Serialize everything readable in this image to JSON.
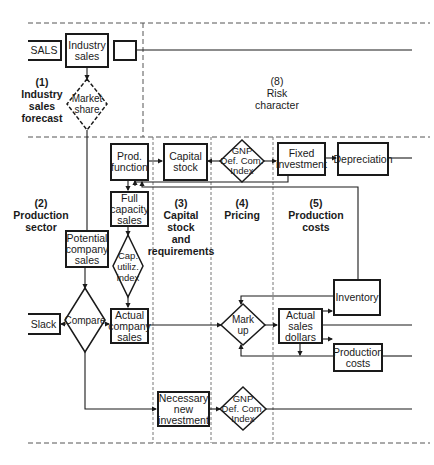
{
  "sections": [
    {
      "number": "(1)",
      "lines": [
        "Industry",
        "sales",
        "forecast"
      ]
    },
    {
      "number": "(2)",
      "lines": [
        "Production",
        "sector"
      ]
    },
    {
      "number": "(3)",
      "lines": [
        "Capital",
        "stock",
        "and",
        "requirements"
      ]
    },
    {
      "number": "(4)",
      "lines": [
        "Pricing"
      ]
    },
    {
      "number": "(5)",
      "lines": [
        "Production",
        "costs"
      ]
    },
    {
      "number": "(8)",
      "lines": [
        "Risk",
        "character"
      ]
    }
  ],
  "boxes": {
    "sals": "SALS",
    "industry_sales": [
      "Industry",
      "sales"
    ],
    "prod_function": [
      "Prod.",
      "function"
    ],
    "capital_stock": [
      "Capital",
      "stock"
    ],
    "fixed_investment": [
      "Fixed",
      "investment"
    ],
    "depreciation": "Depreciation",
    "full_capacity_sales": [
      "Full",
      "capacity",
      "sales"
    ],
    "potential_company_sales": [
      "Potential",
      "company",
      "sales"
    ],
    "slack": "Slack",
    "actual_company_sales": [
      "Actual",
      "company",
      "sales"
    ],
    "actual_sales_dollars": [
      "Actual",
      "sales",
      "dollars"
    ],
    "inventory": "Inventory",
    "production_costs": [
      "Production",
      "costs"
    ],
    "necessary_new_investment": [
      "Necessary",
      "new",
      "investment"
    ]
  },
  "diamonds": {
    "market_share": [
      "Market",
      "share"
    ],
    "gnp_top": [
      "GNP",
      "Def. Com.",
      "Index"
    ],
    "cap_utiliz_index": [
      "Cap.",
      "utiliz.",
      "index"
    ],
    "compare": "Compare",
    "mark_up": [
      "Mark",
      "up"
    ],
    "gnp_bottom": [
      "GNP",
      "Def. Com.",
      "Index"
    ]
  }
}
